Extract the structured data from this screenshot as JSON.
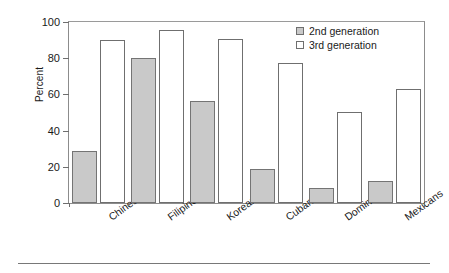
{
  "chart_data": {
    "type": "bar",
    "title": "",
    "xlabel": "",
    "ylabel": "Percent",
    "ylim": [
      0,
      100
    ],
    "yticks": [
      0,
      20,
      40,
      60,
      80,
      100
    ],
    "ytick_labels": [
      "0",
      "20",
      "40",
      "60",
      "80",
      "100"
    ],
    "grid": false,
    "legend_position": "top-right",
    "categories": [
      "Chinese",
      "Filipinos",
      "Koreans",
      "Cubans",
      "Dominicans",
      "Mexicans"
    ],
    "series": [
      {
        "name": "2nd generation",
        "color": "#c9c9c9",
        "values": [
          29,
          80,
          56.5,
          19,
          8.5,
          12.3
        ]
      },
      {
        "name": "3rd generation",
        "color": "#ffffff",
        "values": [
          90,
          95.5,
          90.5,
          77.5,
          50.5,
          63
        ]
      }
    ]
  },
  "legend": {
    "entries": [
      {
        "label": "2nd generation",
        "swatch": "gray-filled-square-icon"
      },
      {
        "label": "3rd generation",
        "swatch": "white-outline-square-icon"
      }
    ]
  }
}
